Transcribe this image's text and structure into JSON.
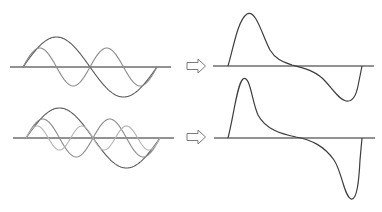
{
  "diagram": {
    "colors": {
      "axis": "#6e6e6e",
      "fundamental": "#5a5a5a",
      "second_harmonic": "#8a8a8a",
      "third_harmonic": "#b4b4b4",
      "result": "#3c3c3c",
      "arrow": "#7a7a7a"
    },
    "rows": [
      {
        "name": "two-harmonics",
        "components": [
          {
            "name": "fundamental",
            "harmonic": 1,
            "amplitude": 30
          },
          {
            "name": "second-harmonic",
            "harmonic": 2,
            "amplitude": 19
          }
        ],
        "arrow": "right-outline-arrow",
        "result": "composite waveform with one peak and one trough"
      },
      {
        "name": "three-harmonics",
        "components": [
          {
            "name": "fundamental",
            "harmonic": 1,
            "amplitude": 30
          },
          {
            "name": "second-harmonic",
            "harmonic": 2,
            "amplitude": 19
          },
          {
            "name": "third-harmonic",
            "harmonic": 3,
            "amplitude": 12
          }
        ],
        "arrow": "right-outline-arrow",
        "result": "sharper composite waveform with narrower peak and trough"
      }
    ]
  }
}
